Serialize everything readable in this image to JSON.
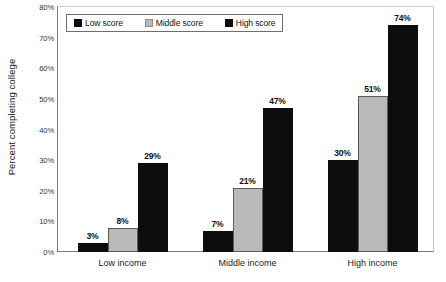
{
  "chart_data": {
    "type": "bar",
    "title": "",
    "subtitle": "",
    "xlabel": "",
    "ylabel": "Percent completing college",
    "categories": [
      "Low income",
      "Middle income",
      "High income"
    ],
    "series": [
      {
        "name": "Low score",
        "values": [
          3,
          8,
          30
        ],
        "color": "#0d0d0d"
      },
      {
        "name": "Middle score",
        "values": [
          8,
          21,
          51
        ],
        "color": "#b9b9b9"
      },
      {
        "name": "High score",
        "values": [
          29,
          47,
          74
        ],
        "color": "#0d0d0d"
      }
    ],
    "data_labels": [
      [
        "3%",
        "8%",
        "29%"
      ],
      [
        "7%",
        "21%",
        "47%"
      ],
      [
        "30%",
        "51%",
        "74%"
      ]
    ],
    "group_values": [
      [
        3,
        8,
        29
      ],
      [
        7,
        21,
        47
      ],
      [
        30,
        51,
        74
      ]
    ],
    "ylim": [
      0,
      80
    ],
    "ytick_values": [
      0,
      10,
      20,
      30,
      40,
      50,
      60,
      70,
      80
    ],
    "ytick_labels": [
      "0%",
      "10%",
      "20%",
      "30%",
      "40%",
      "50%",
      "60%",
      "70%",
      "80%"
    ],
    "grid": false,
    "legend_position": "top-left-inside",
    "bar_border_color": "#3a3a3a",
    "axis_color": "#7a7a7a",
    "background": "#ffffff"
  },
  "axis": {
    "y_title": "Percent completing college"
  },
  "legend": {
    "items": [
      {
        "label": "Low score",
        "swatch": "dark"
      },
      {
        "label": "Middle score",
        "swatch": "gray"
      },
      {
        "label": "High score",
        "swatch": "dark"
      }
    ]
  }
}
